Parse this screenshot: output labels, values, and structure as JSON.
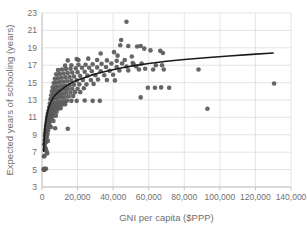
{
  "chart_data": {
    "type": "scatter",
    "title": "",
    "xlabel": "GNI per capita ($PPP)",
    "ylabel": "Expected years of schooling (years)",
    "xlim": [
      0,
      140000
    ],
    "ylim": [
      3,
      23
    ],
    "xticks": [
      0,
      20000,
      40000,
      60000,
      80000,
      100000,
      120000,
      140000
    ],
    "xticklabels": [
      "0",
      "20,000",
      "40,000",
      "60,000",
      "80,000",
      "100,000",
      "120,000",
      "140,000"
    ],
    "yticks": [
      3,
      5,
      7,
      9,
      11,
      13,
      15,
      17,
      19,
      21,
      23
    ],
    "yticklabels": [
      "3",
      "5",
      "7",
      "9",
      "11",
      "13",
      "15",
      "17",
      "19",
      "21",
      "23"
    ],
    "grid": "horizontal-and-vertical",
    "grid_color": "#d9d9d9",
    "marker_color": "#595959",
    "marker_size": 4.6,
    "trendline": {
      "type": "logarithmic",
      "color": "#1a1a1a",
      "width": 1.6,
      "points": [
        [
          900,
          7.1
        ],
        [
          1200,
          8.4
        ],
        [
          1600,
          9.6
        ],
        [
          2100,
          10.5
        ],
        [
          2800,
          11.3
        ],
        [
          3600,
          12.0
        ],
        [
          4600,
          12.6
        ],
        [
          5800,
          13.1
        ],
        [
          7200,
          13.5
        ],
        [
          9000,
          13.9
        ],
        [
          11000,
          14.2
        ],
        [
          13500,
          14.6
        ],
        [
          16000,
          14.9
        ],
        [
          19000,
          15.2
        ],
        [
          23000,
          15.5
        ],
        [
          27000,
          15.8
        ],
        [
          32000,
          16.1
        ],
        [
          38000,
          16.4
        ],
        [
          45000,
          16.7
        ],
        [
          52000,
          16.95
        ],
        [
          60000,
          17.2
        ],
        [
          70000,
          17.45
        ],
        [
          80000,
          17.65
        ],
        [
          92000,
          17.85
        ],
        [
          105000,
          18.05
        ],
        [
          118000,
          18.25
        ],
        [
          130000,
          18.4
        ]
      ]
    },
    "series": [
      {
        "name": "countries",
        "points": [
          [
            950,
            5.0
          ],
          [
            1100,
            5.05
          ],
          [
            1250,
            4.95
          ],
          [
            1400,
            5.1
          ],
          [
            1350,
            6.6
          ],
          [
            2900,
            6.85
          ],
          [
            1500,
            7.3
          ],
          [
            2100,
            7.4
          ],
          [
            1700,
            7.6
          ],
          [
            1250,
            7.9
          ],
          [
            1900,
            8.1
          ],
          [
            2400,
            8.2
          ],
          [
            1500,
            8.4
          ],
          [
            2000,
            8.6
          ],
          [
            2700,
            8.7
          ],
          [
            1600,
            8.9
          ],
          [
            2300,
            9.0
          ],
          [
            3100,
            9.1
          ],
          [
            1800,
            9.25
          ],
          [
            2600,
            9.4
          ],
          [
            3400,
            9.5
          ],
          [
            2000,
            9.6
          ],
          [
            2900,
            9.75
          ],
          [
            3700,
            9.85
          ],
          [
            7400,
            9.75
          ],
          [
            2200,
            10.0
          ],
          [
            3200,
            10.1
          ],
          [
            4100,
            10.2
          ],
          [
            2500,
            10.35
          ],
          [
            3500,
            10.45
          ],
          [
            4400,
            10.55
          ],
          [
            2700,
            10.7
          ],
          [
            3800,
            10.8
          ],
          [
            4800,
            10.9
          ],
          [
            5600,
            11.0
          ],
          [
            2900,
            11.05
          ],
          [
            4000,
            11.15
          ],
          [
            5000,
            11.25
          ],
          [
            6200,
            11.3
          ],
          [
            3200,
            11.4
          ],
          [
            4400,
            11.5
          ],
          [
            5400,
            11.55
          ],
          [
            6800,
            11.6
          ],
          [
            8200,
            11.65
          ],
          [
            3600,
            11.75
          ],
          [
            4800,
            11.85
          ],
          [
            6000,
            11.9
          ],
          [
            7400,
            11.95
          ],
          [
            9000,
            12.0
          ],
          [
            10500,
            12.05
          ],
          [
            4000,
            12.15
          ],
          [
            5200,
            12.2
          ],
          [
            6600,
            12.3
          ],
          [
            8000,
            12.35
          ],
          [
            9600,
            12.4
          ],
          [
            11200,
            12.45
          ],
          [
            13000,
            12.5
          ],
          [
            4400,
            12.6
          ],
          [
            5800,
            12.65
          ],
          [
            7200,
            12.7
          ],
          [
            8800,
            12.75
          ],
          [
            10400,
            12.8
          ],
          [
            12200,
            12.85
          ],
          [
            14000,
            12.9
          ],
          [
            16500,
            12.9
          ],
          [
            19500,
            12.9
          ],
          [
            24000,
            12.95
          ],
          [
            28500,
            12.9
          ],
          [
            32500,
            12.9
          ],
          [
            4800,
            13.1
          ],
          [
            6200,
            13.15
          ],
          [
            7600,
            13.2
          ],
          [
            9200,
            13.25
          ],
          [
            11000,
            13.3
          ],
          [
            12800,
            13.35
          ],
          [
            15000,
            13.4
          ],
          [
            17500,
            13.45
          ],
          [
            5200,
            13.55
          ],
          [
            6600,
            13.6
          ],
          [
            8200,
            13.65
          ],
          [
            9800,
            13.7
          ],
          [
            11600,
            13.75
          ],
          [
            13600,
            13.8
          ],
          [
            16000,
            13.85
          ],
          [
            18500,
            13.9
          ],
          [
            21500,
            13.9
          ],
          [
            5600,
            14.0
          ],
          [
            7000,
            14.05
          ],
          [
            8600,
            14.1
          ],
          [
            10400,
            14.15
          ],
          [
            12400,
            14.2
          ],
          [
            14500,
            14.25
          ],
          [
            17000,
            14.3
          ],
          [
            20000,
            14.3
          ],
          [
            23500,
            14.35
          ],
          [
            6000,
            14.45
          ],
          [
            7600,
            14.5
          ],
          [
            9200,
            14.55
          ],
          [
            11200,
            14.6
          ],
          [
            13200,
            14.65
          ],
          [
            15500,
            14.7
          ],
          [
            18000,
            14.75
          ],
          [
            21000,
            14.8
          ],
          [
            25000,
            14.8
          ],
          [
            29000,
            14.85
          ],
          [
            6600,
            14.95
          ],
          [
            8200,
            15.0
          ],
          [
            10000,
            15.05
          ],
          [
            12000,
            15.1
          ],
          [
            14200,
            15.15
          ],
          [
            16500,
            15.2
          ],
          [
            19500,
            15.25
          ],
          [
            23000,
            15.3
          ],
          [
            27500,
            15.3
          ],
          [
            31500,
            15.35
          ],
          [
            36500,
            15.3
          ],
          [
            41000,
            15.25
          ],
          [
            7200,
            15.45
          ],
          [
            9000,
            15.5
          ],
          [
            11000,
            15.55
          ],
          [
            13200,
            15.6
          ],
          [
            15500,
            15.65
          ],
          [
            18000,
            15.7
          ],
          [
            21500,
            15.75
          ],
          [
            25500,
            15.8
          ],
          [
            30000,
            15.85
          ],
          [
            35000,
            15.85
          ],
          [
            40000,
            15.9
          ],
          [
            8000,
            15.95
          ],
          [
            10000,
            16.0
          ],
          [
            12200,
            16.05
          ],
          [
            14500,
            16.1
          ],
          [
            17000,
            16.15
          ],
          [
            20000,
            16.2
          ],
          [
            24000,
            16.25
          ],
          [
            28000,
            16.3
          ],
          [
            33000,
            16.3
          ],
          [
            38000,
            16.35
          ],
          [
            43500,
            16.4
          ],
          [
            48500,
            16.4
          ],
          [
            9000,
            16.45
          ],
          [
            11200,
            16.5
          ],
          [
            13500,
            16.55
          ],
          [
            16000,
            16.6
          ],
          [
            19000,
            16.65
          ],
          [
            22500,
            16.7
          ],
          [
            26500,
            16.7
          ],
          [
            31000,
            16.75
          ],
          [
            36000,
            16.8
          ],
          [
            42000,
            16.8
          ],
          [
            47500,
            16.85
          ],
          [
            53000,
            16.85
          ],
          [
            58000,
            16.6
          ],
          [
            62500,
            16.5
          ],
          [
            68500,
            16.5
          ],
          [
            13000,
            16.95
          ],
          [
            16500,
            17.0
          ],
          [
            20500,
            17.05
          ],
          [
            24500,
            17.05
          ],
          [
            28500,
            17.1
          ],
          [
            33500,
            17.15
          ],
          [
            39000,
            17.2
          ],
          [
            45000,
            17.2
          ],
          [
            51000,
            17.25
          ],
          [
            56000,
            17.2
          ],
          [
            64000,
            17.0
          ],
          [
            67500,
            17.0
          ],
          [
            14500,
            17.55
          ],
          [
            20500,
            17.6
          ],
          [
            26000,
            17.75
          ],
          [
            31000,
            17.6
          ],
          [
            36500,
            17.55
          ],
          [
            42000,
            17.5
          ],
          [
            46500,
            17.6
          ],
          [
            51500,
            17.1
          ],
          [
            19500,
            17.7
          ],
          [
            33000,
            18.35
          ],
          [
            40500,
            18.5
          ],
          [
            44000,
            19.3
          ],
          [
            48500,
            19.2
          ],
          [
            53500,
            19.15
          ],
          [
            55500,
            19.2
          ],
          [
            57500,
            18.9
          ],
          [
            61000,
            18.7
          ],
          [
            66500,
            18.65
          ],
          [
            68000,
            18.4
          ],
          [
            47500,
            22.0
          ],
          [
            44500,
            19.9
          ],
          [
            42500,
            18.1
          ],
          [
            50500,
            18.0
          ],
          [
            54500,
            16.5
          ],
          [
            59500,
            14.4
          ],
          [
            63500,
            14.4
          ],
          [
            67000,
            14.45
          ],
          [
            71500,
            14.4
          ],
          [
            55500,
            13.3
          ],
          [
            88000,
            16.5
          ],
          [
            93000,
            12.0
          ],
          [
            130500,
            14.9
          ],
          [
            14500,
            9.7
          ],
          [
            7800,
            11.2
          ],
          [
            6400,
            10.6
          ],
          [
            5000,
            9.9
          ],
          [
            3300,
            8.3
          ],
          [
            2600,
            7.1
          ],
          [
            1150,
            6.5
          ],
          [
            2250,
            5.1
          ]
        ]
      }
    ]
  }
}
